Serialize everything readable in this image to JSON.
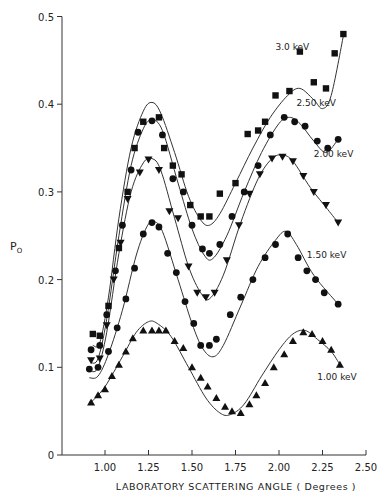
{
  "chart_data": {
    "type": "line",
    "title": "",
    "xlabel": "LABORATORY SCATTERING ANGLE ( Degrees )",
    "ylabel": "P",
    "ylabel_subscript": "O",
    "xlim": [
      0.75,
      2.55
    ],
    "ylim": [
      0,
      0.5
    ],
    "xticks": [
      1.0,
      1.25,
      1.5,
      1.75,
      2.0,
      2.25,
      2.5
    ],
    "xtick_labels": [
      "1.00",
      "1.25",
      "1.50",
      "1.75",
      "2.00",
      "2.25",
      "2.50"
    ],
    "yticks": [
      0,
      0.1,
      0.2,
      0.3,
      0.4,
      0.5
    ],
    "ytick_labels": [
      "0",
      "0.1",
      "0.2",
      "0.3",
      "0.4",
      "0.5"
    ],
    "grid": false,
    "legend": "inline labels at right end of each curve",
    "series": [
      {
        "name": "3.0 keV",
        "marker": "square",
        "points": [
          [
            0.93,
            0.138
          ],
          [
            0.97,
            0.136
          ],
          [
            1.02,
            0.17
          ],
          [
            1.08,
            0.236
          ],
          [
            1.13,
            0.3
          ],
          [
            1.17,
            0.35
          ],
          [
            1.22,
            0.38
          ],
          [
            1.31,
            0.385
          ],
          [
            1.34,
            0.35
          ],
          [
            1.39,
            0.33
          ],
          [
            1.44,
            0.32
          ],
          [
            1.49,
            0.285
          ],
          [
            1.55,
            0.272
          ],
          [
            1.6,
            0.272
          ],
          [
            1.66,
            0.298
          ],
          [
            1.75,
            0.31
          ],
          [
            1.82,
            0.366
          ],
          [
            1.88,
            0.37
          ],
          [
            1.92,
            0.38
          ],
          [
            1.98,
            0.41
          ],
          [
            2.06,
            0.415
          ],
          [
            2.12,
            0.46
          ],
          [
            2.2,
            0.425
          ],
          [
            2.27,
            0.418
          ],
          [
            2.32,
            0.458
          ],
          [
            2.37,
            0.48
          ]
        ],
        "curve": [
          [
            0.93,
            0.125
          ],
          [
            0.97,
            0.128
          ],
          [
            1.02,
            0.18
          ],
          [
            1.08,
            0.27
          ],
          [
            1.15,
            0.35
          ],
          [
            1.22,
            0.392
          ],
          [
            1.27,
            0.402
          ],
          [
            1.32,
            0.39
          ],
          [
            1.4,
            0.345
          ],
          [
            1.48,
            0.295
          ],
          [
            1.55,
            0.268
          ],
          [
            1.6,
            0.262
          ],
          [
            1.66,
            0.275
          ],
          [
            1.75,
            0.31
          ],
          [
            1.85,
            0.35
          ],
          [
            1.95,
            0.385
          ],
          [
            2.05,
            0.41
          ],
          [
            2.12,
            0.418
          ],
          [
            2.2,
            0.405
          ],
          [
            2.25,
            0.395
          ],
          [
            2.3,
            0.41
          ],
          [
            2.37,
            0.478
          ]
        ]
      },
      {
        "name": "2.50 keV",
        "marker": "circle",
        "points": [
          [
            0.92,
            0.12
          ],
          [
            0.97,
            0.125
          ],
          [
            1.01,
            0.16
          ],
          [
            1.06,
            0.21
          ],
          [
            1.1,
            0.262
          ],
          [
            1.15,
            0.325
          ],
          [
            1.19,
            0.368
          ],
          [
            1.27,
            0.381
          ],
          [
            1.33,
            0.365
          ],
          [
            1.39,
            0.315
          ],
          [
            1.45,
            0.3
          ],
          [
            1.5,
            0.262
          ],
          [
            1.56,
            0.235
          ],
          [
            1.6,
            0.23
          ],
          [
            1.66,
            0.24
          ],
          [
            1.73,
            0.272
          ],
          [
            1.8,
            0.3
          ],
          [
            1.88,
            0.33
          ],
          [
            1.95,
            0.365
          ],
          [
            2.03,
            0.385
          ],
          [
            2.09,
            0.38
          ],
          [
            2.15,
            0.375
          ],
          [
            2.22,
            0.358
          ],
          [
            2.28,
            0.35
          ],
          [
            2.34,
            0.36
          ]
        ],
        "curve": [
          [
            0.92,
            0.105
          ],
          [
            0.96,
            0.11
          ],
          [
            1.01,
            0.155
          ],
          [
            1.08,
            0.25
          ],
          [
            1.15,
            0.33
          ],
          [
            1.22,
            0.372
          ],
          [
            1.27,
            0.382
          ],
          [
            1.33,
            0.37
          ],
          [
            1.42,
            0.31
          ],
          [
            1.5,
            0.258
          ],
          [
            1.57,
            0.228
          ],
          [
            1.62,
            0.224
          ],
          [
            1.7,
            0.25
          ],
          [
            1.8,
            0.3
          ],
          [
            1.9,
            0.345
          ],
          [
            2.0,
            0.378
          ],
          [
            2.06,
            0.385
          ],
          [
            2.12,
            0.378
          ],
          [
            2.2,
            0.358
          ],
          [
            2.27,
            0.345
          ],
          [
            2.34,
            0.36
          ]
        ]
      },
      {
        "name": "2.00 keV",
        "marker": "triangle-down",
        "points": [
          [
            0.92,
            0.108
          ],
          [
            0.97,
            0.11
          ],
          [
            1.01,
            0.148
          ],
          [
            1.05,
            0.2
          ],
          [
            1.09,
            0.242
          ],
          [
            1.13,
            0.292
          ],
          [
            1.2,
            0.322
          ],
          [
            1.25,
            0.337
          ],
          [
            1.31,
            0.325
          ],
          [
            1.37,
            0.278
          ],
          [
            1.42,
            0.27
          ],
          [
            1.48,
            0.215
          ],
          [
            1.53,
            0.185
          ],
          [
            1.58,
            0.18
          ],
          [
            1.63,
            0.185
          ],
          [
            1.7,
            0.222
          ],
          [
            1.77,
            0.262
          ],
          [
            1.83,
            0.298
          ],
          [
            1.89,
            0.32
          ],
          [
            1.96,
            0.338
          ],
          [
            2.02,
            0.34
          ],
          [
            2.08,
            0.335
          ],
          [
            2.14,
            0.318
          ],
          [
            2.2,
            0.3
          ],
          [
            2.27,
            0.285
          ],
          [
            2.34,
            0.265
          ]
        ],
        "curve": [
          [
            0.92,
            0.095
          ],
          [
            0.96,
            0.1
          ],
          [
            1.01,
            0.14
          ],
          [
            1.08,
            0.23
          ],
          [
            1.15,
            0.3
          ],
          [
            1.22,
            0.333
          ],
          [
            1.27,
            0.338
          ],
          [
            1.32,
            0.325
          ],
          [
            1.4,
            0.27
          ],
          [
            1.48,
            0.215
          ],
          [
            1.55,
            0.185
          ],
          [
            1.6,
            0.178
          ],
          [
            1.68,
            0.205
          ],
          [
            1.78,
            0.265
          ],
          [
            1.88,
            0.315
          ],
          [
            1.96,
            0.338
          ],
          [
            2.02,
            0.342
          ],
          [
            2.08,
            0.335
          ],
          [
            2.18,
            0.305
          ],
          [
            2.28,
            0.28
          ],
          [
            2.34,
            0.265
          ]
        ]
      },
      {
        "name": "1.50 keV",
        "marker": "circle",
        "points": [
          [
            0.91,
            0.098
          ],
          [
            0.96,
            0.1
          ],
          [
            1.02,
            0.118
          ],
          [
            1.07,
            0.145
          ],
          [
            1.12,
            0.178
          ],
          [
            1.17,
            0.213
          ],
          [
            1.22,
            0.252
          ],
          [
            1.27,
            0.265
          ],
          [
            1.31,
            0.26
          ],
          [
            1.36,
            0.23
          ],
          [
            1.41,
            0.208
          ],
          [
            1.46,
            0.175
          ],
          [
            1.51,
            0.15
          ],
          [
            1.55,
            0.125
          ],
          [
            1.6,
            0.125
          ],
          [
            1.64,
            0.132
          ],
          [
            1.72,
            0.16
          ],
          [
            1.78,
            0.18
          ],
          [
            1.85,
            0.2
          ],
          [
            1.92,
            0.225
          ],
          [
            1.98,
            0.24
          ],
          [
            2.05,
            0.252
          ],
          [
            2.11,
            0.225
          ],
          [
            2.16,
            0.21
          ],
          [
            2.21,
            0.2
          ],
          [
            2.26,
            0.185
          ],
          [
            2.34,
            0.172
          ]
        ],
        "curve": [
          [
            0.91,
            0.088
          ],
          [
            0.96,
            0.09
          ],
          [
            1.02,
            0.115
          ],
          [
            1.1,
            0.165
          ],
          [
            1.18,
            0.228
          ],
          [
            1.24,
            0.26
          ],
          [
            1.28,
            0.266
          ],
          [
            1.33,
            0.255
          ],
          [
            1.42,
            0.2
          ],
          [
            1.5,
            0.15
          ],
          [
            1.56,
            0.122
          ],
          [
            1.62,
            0.112
          ],
          [
            1.68,
            0.125
          ],
          [
            1.78,
            0.17
          ],
          [
            1.88,
            0.215
          ],
          [
            1.98,
            0.245
          ],
          [
            2.04,
            0.255
          ],
          [
            2.1,
            0.24
          ],
          [
            2.2,
            0.205
          ],
          [
            2.34,
            0.172
          ]
        ]
      },
      {
        "name": "1.00 keV",
        "marker": "triangle-up",
        "points": [
          [
            0.92,
            0.06
          ],
          [
            0.96,
            0.068
          ],
          [
            1.0,
            0.075
          ],
          [
            1.04,
            0.09
          ],
          [
            1.08,
            0.103
          ],
          [
            1.12,
            0.118
          ],
          [
            1.16,
            0.133
          ],
          [
            1.22,
            0.142
          ],
          [
            1.27,
            0.142
          ],
          [
            1.31,
            0.142
          ],
          [
            1.35,
            0.142
          ],
          [
            1.4,
            0.13
          ],
          [
            1.45,
            0.122
          ],
          [
            1.5,
            0.1
          ],
          [
            1.55,
            0.088
          ],
          [
            1.59,
            0.078
          ],
          [
            1.64,
            0.065
          ],
          [
            1.69,
            0.055
          ],
          [
            1.73,
            0.05
          ],
          [
            1.78,
            0.048
          ],
          [
            1.83,
            0.058
          ],
          [
            1.87,
            0.068
          ],
          [
            1.92,
            0.082
          ],
          [
            1.97,
            0.1
          ],
          [
            2.03,
            0.115
          ],
          [
            2.08,
            0.13
          ],
          [
            2.14,
            0.14
          ],
          [
            2.19,
            0.138
          ],
          [
            2.25,
            0.13
          ],
          [
            2.3,
            0.12
          ],
          [
            2.35,
            0.103
          ]
        ],
        "curve": [
          [
            0.92,
            0.06
          ],
          [
            1.0,
            0.078
          ],
          [
            1.1,
            0.112
          ],
          [
            1.18,
            0.14
          ],
          [
            1.25,
            0.152
          ],
          [
            1.3,
            0.15
          ],
          [
            1.38,
            0.135
          ],
          [
            1.48,
            0.1
          ],
          [
            1.58,
            0.065
          ],
          [
            1.66,
            0.048
          ],
          [
            1.72,
            0.046
          ],
          [
            1.8,
            0.058
          ],
          [
            1.9,
            0.09
          ],
          [
            2.0,
            0.12
          ],
          [
            2.08,
            0.138
          ],
          [
            2.15,
            0.142
          ],
          [
            2.22,
            0.132
          ],
          [
            2.3,
            0.118
          ],
          [
            2.35,
            0.103
          ]
        ]
      }
    ]
  }
}
